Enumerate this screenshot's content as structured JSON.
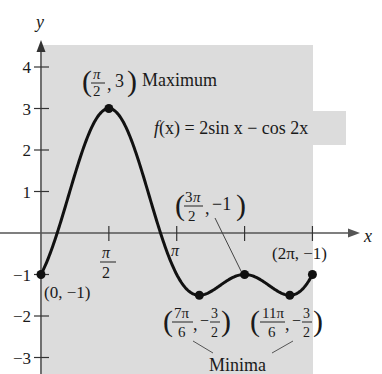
{
  "chart_data": {
    "type": "line",
    "title": "",
    "function_label": "f(x) = 2sin x − cos 2x",
    "xlabel": "x",
    "ylabel": "y",
    "xlim": [
      0,
      6.2832
    ],
    "ylim": [
      -3.3,
      4.5
    ],
    "grid": false,
    "x_ticks": [
      {
        "value": 1.5708,
        "label_num": "π",
        "label_den": "2"
      },
      {
        "value": 3.1416,
        "label": "π"
      },
      {
        "value": 4.7124,
        "label": ""
      },
      {
        "value": 6.2832,
        "label": ""
      }
    ],
    "y_ticks": [
      -3,
      -2,
      -1,
      1,
      2,
      3,
      4
    ],
    "y_tick_labels": [
      "−3",
      "−2",
      "−1",
      "1",
      "2",
      "3",
      "4"
    ],
    "series": [
      {
        "name": "f(x) = 2sin x − cos 2x",
        "expression": "2*sin(x) - cos(2*x)",
        "domain": [
          0,
          6.2832
        ]
      }
    ],
    "key_points": [
      {
        "x": 0,
        "y": -1,
        "label": "(0, −1)"
      },
      {
        "x": 1.5708,
        "y": 3,
        "label": "(π/2, 3)",
        "note": "Maximum"
      },
      {
        "x": 3.6652,
        "y": -1.5,
        "label": "(7π/6, −3/2)",
        "note": "Minima"
      },
      {
        "x": 4.7124,
        "y": -1,
        "label": "(3π/2, −1)"
      },
      {
        "x": 5.7596,
        "y": -1.5,
        "label": "(11π/6, −3/2)",
        "note": "Minima"
      },
      {
        "x": 6.2832,
        "y": -1,
        "label": "(2π, −1)"
      }
    ],
    "annotations": {
      "maximum": "Maximum",
      "minima": "Minima"
    }
  },
  "labels": {
    "y_axis": "y",
    "x_axis": "x",
    "pi": "π",
    "two": "2",
    "maximum": "Maximum",
    "minima": "Minima",
    "fx_f": "f",
    "fx_rest": "(x) = 2sin x − cos 2x",
    "pt_origin": "(0, −1)",
    "pt_end": "(2π, −1)",
    "three": "3",
    "neg_one": "−1",
    "three_pi": "3π",
    "seven_pi": "7π",
    "eleven_pi": "11π",
    "six": "6",
    "neg": "−",
    "comma": ","
  }
}
